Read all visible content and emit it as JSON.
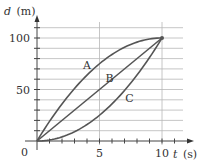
{
  "chart_data": {
    "type": "line",
    "title": "",
    "xlabel": "t (s)",
    "ylabel": "d (m)",
    "xlabel_var": "t",
    "xlabel_unit": "(s)",
    "ylabel_var": "d",
    "ylabel_unit": "(m)",
    "xlim": [
      0,
      10
    ],
    "ylim": [
      0,
      110
    ],
    "x_ticks": [
      0,
      5,
      10
    ],
    "y_ticks": [
      0,
      50,
      100
    ],
    "x_tick_labels": [
      "0",
      "5",
      "10"
    ],
    "y_tick_labels": [
      "50",
      "100"
    ],
    "origin_label": "0",
    "grid": true,
    "grid_y_step": 10,
    "grid_x_lines": [
      5,
      10
    ],
    "x": [
      0,
      1,
      2,
      3,
      4,
      5,
      6,
      7,
      8,
      9,
      10
    ],
    "series": [
      {
        "name": "A",
        "values": [
          0,
          19,
          36,
          51,
          64,
          75,
          84,
          91,
          96,
          99,
          100
        ]
      },
      {
        "name": "B",
        "values": [
          0,
          10,
          20,
          30,
          40,
          50,
          60,
          70,
          80,
          90,
          100
        ]
      },
      {
        "name": "C",
        "values": [
          0,
          1,
          4,
          9,
          16,
          25,
          36,
          49,
          64,
          81,
          100
        ]
      }
    ],
    "annotations": [
      {
        "text": "A",
        "x": 4.0,
        "y": 70
      },
      {
        "text": "B",
        "x": 5.8,
        "y": 57
      },
      {
        "text": "C",
        "x": 7.4,
        "y": 38
      }
    ],
    "legend": "none (curves labeled inline)",
    "line_color": "#555555",
    "grid_color": "#b8b8b8"
  }
}
